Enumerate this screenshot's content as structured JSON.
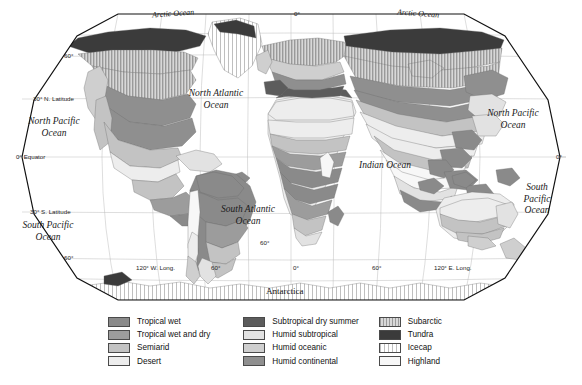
{
  "map": {
    "projection": "robinson",
    "title_present": false,
    "ocean_labels": [
      {
        "name": "arctic-ocean-left",
        "text": "Arctic Ocean",
        "x": 160,
        "y": 12,
        "size": "minor",
        "rot": -4
      },
      {
        "name": "arctic-ocean-right",
        "text": "Arctic Ocean",
        "x": 405,
        "y": 12,
        "size": "minor",
        "rot": 4
      },
      {
        "name": "north-atlantic-ocean",
        "text": "North Atlantic\nOcean",
        "x": 209,
        "y": 96,
        "size": "major",
        "rot": 0
      },
      {
        "name": "north-pacific-ocean-left",
        "text": "North Pacific\nOcean",
        "x": 48,
        "y": 124,
        "size": "major",
        "rot": 0
      },
      {
        "name": "south-pacific-ocean-left",
        "text": "South Pacific\nOcean",
        "x": 42,
        "y": 228,
        "size": "major",
        "rot": 0
      },
      {
        "name": "south-atlantic-ocean",
        "text": "South Atlantic\nOcean",
        "x": 243,
        "y": 212,
        "size": "major",
        "rot": 0
      },
      {
        "name": "indian-ocean",
        "text": "Indian Ocean",
        "x": 383,
        "y": 167,
        "size": "major",
        "rot": 0
      },
      {
        "name": "north-pacific-ocean-right",
        "text": "North Pacific\nOcean",
        "x": 509,
        "y": 116,
        "size": "major",
        "rot": 0
      },
      {
        "name": "south-pacific-ocean-right",
        "text": "South\nPacific\nOcean",
        "x": 535,
        "y": 196,
        "size": "major",
        "rot": 0
      }
    ],
    "continent_label": {
      "text": "Antarctica",
      "x": 271,
      "y": 292
    },
    "latitude_labels": [
      {
        "text": "60°",
        "x": 67,
        "y": 57
      },
      {
        "text": "30° N. Latitude",
        "x": 33,
        "y": 99
      },
      {
        "text": "0° Equator",
        "x": 18,
        "y": 157
      },
      {
        "text": "30° S. Latitude",
        "x": 30,
        "y": 212
      },
      {
        "text": "60°",
        "x": 66,
        "y": 258
      },
      {
        "text": "0°",
        "x": 560,
        "y": 157
      }
    ],
    "longitude_labels": [
      {
        "text": "0°",
        "x": 296,
        "y": 12
      },
      {
        "text": "120° W. Long.",
        "x": 139,
        "y": 268
      },
      {
        "text": "60°",
        "x": 213,
        "y": 268
      },
      {
        "text": "0°",
        "x": 295,
        "y": 268
      },
      {
        "text": "60°",
        "x": 374,
        "y": 268
      },
      {
        "text": "120° E. Long.",
        "x": 437,
        "y": 268
      },
      {
        "text": "60°",
        "x": 262,
        "y": 243
      }
    ]
  },
  "legend": {
    "columns": [
      {
        "name": "legend-column-1",
        "items": [
          {
            "label": "Tropical wet",
            "fill": "#8a8a8a",
            "pattern": "solid"
          },
          {
            "label": "Tropical wet and dry",
            "fill": "#9c9c9c",
            "pattern": "solid"
          },
          {
            "label": "Semiarid",
            "fill": "#c3c3c3",
            "pattern": "solid"
          },
          {
            "label": "Desert",
            "fill": "#ededed",
            "pattern": "solid"
          }
        ]
      },
      {
        "name": "legend-column-2",
        "items": [
          {
            "label": "Subtropical dry summer",
            "fill": "#5c5c5c",
            "pattern": "solid"
          },
          {
            "label": "Humid subtropical",
            "fill": "#e2e2e2",
            "pattern": "solid"
          },
          {
            "label": "Humid oceanic",
            "fill": "#cfcfcf",
            "pattern": "solid"
          },
          {
            "label": "Humid continental",
            "fill": "#8f8f8f",
            "pattern": "solid"
          }
        ]
      },
      {
        "name": "legend-column-3",
        "items": [
          {
            "label": "Subarctic",
            "fill": "#b5b5b5",
            "pattern": "vstripe-dense"
          },
          {
            "label": "Tundra",
            "fill": "#3b3b3b",
            "pattern": "solid"
          },
          {
            "label": "Icecap",
            "fill": "#f2f2f2",
            "pattern": "vstripe-light"
          },
          {
            "label": "Highland",
            "fill": "#f7f7f7",
            "pattern": "solid"
          }
        ]
      }
    ]
  },
  "colors": {
    "tropical_wet": "#8a8a8a",
    "tropical_wet_dry": "#9c9c9c",
    "semiarid": "#c3c3c3",
    "desert": "#ededed",
    "subtropical_dry_summer": "#5c5c5c",
    "humid_subtropical": "#e2e2e2",
    "humid_oceanic": "#cfcfcf",
    "humid_continental": "#8f8f8f",
    "subarctic": "#b5b5b5",
    "tundra": "#3b3b3b",
    "icecap": "#f2f2f2",
    "highland": "#f7f7f7",
    "ocean": "#ffffff",
    "graticule": "#b9b9b9",
    "outline": "#1a1a1a",
    "background": "#ffffff"
  }
}
